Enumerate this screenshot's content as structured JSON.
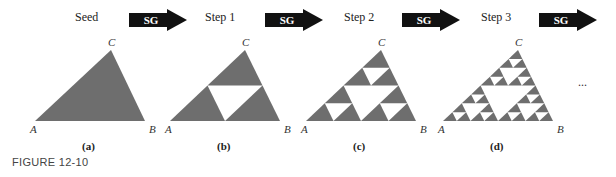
{
  "fill_color": "#6e6e6e",
  "arrow_label": "SG",
  "stages": [
    {
      "title": "Seed",
      "caption": "(a)",
      "steps": 0,
      "A": [
        35,
        121
      ],
      "B": [
        145,
        121
      ],
      "C": [
        111,
        50
      ],
      "title_pos": [
        75,
        10
      ],
      "arrow_pos": [
        129,
        9
      ]
    },
    {
      "title": "Step 1",
      "caption": "(b)",
      "steps": 1,
      "A": [
        170,
        121
      ],
      "B": [
        280,
        121
      ],
      "C": [
        245,
        50
      ],
      "title_pos": [
        205,
        10
      ],
      "arrow_pos": [
        265,
        9
      ]
    },
    {
      "title": "Step 2",
      "caption": "(c)",
      "steps": 2,
      "A": [
        306,
        121
      ],
      "B": [
        416,
        121
      ],
      "C": [
        381,
        50
      ],
      "title_pos": [
        344,
        10
      ],
      "arrow_pos": [
        402,
        9
      ]
    },
    {
      "title": "Step 3",
      "caption": "(d)",
      "steps": 3,
      "A": [
        443,
        121
      ],
      "B": [
        553,
        121
      ],
      "C": [
        518,
        50
      ],
      "title_pos": [
        481,
        10
      ],
      "arrow_pos": [
        539,
        9
      ]
    }
  ],
  "vertex_labels": {
    "A": "A",
    "B": "B",
    "C": "C"
  },
  "ellipsis": "...",
  "figure_label": "FIGURE 12-10"
}
